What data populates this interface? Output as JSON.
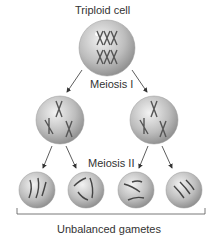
{
  "title": "Triploid cell",
  "stage1": "Meiosis I",
  "stage2": "Meiosis II",
  "result": "Unbalanced gametes"
}
